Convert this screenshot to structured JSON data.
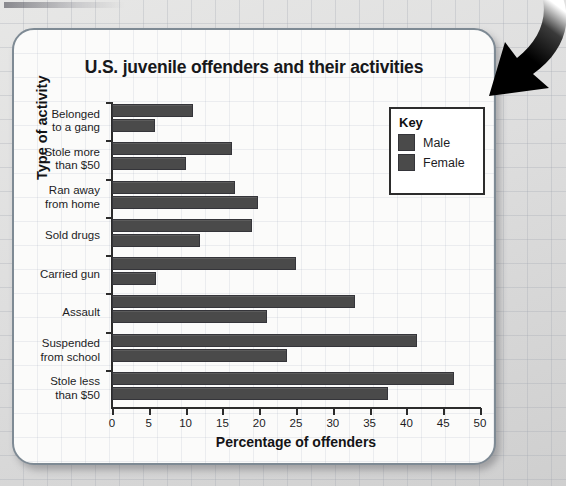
{
  "page": {
    "background_color": "#d9d9d9",
    "card_color": "#fbfbfa",
    "accent_color": "#4a4a4a",
    "axis_color": "#2c2c2c"
  },
  "annotation": {
    "arrow_name": "curved-down-left-arrow",
    "arrow_color": "#000000"
  },
  "chart_data": {
    "type": "bar",
    "orientation": "horizontal",
    "title": "U.S. juvenile offenders and their activities",
    "xlabel": "Percentage of offenders",
    "ylabel": "Type of activity",
    "xlim": [
      0,
      50
    ],
    "xticks": [
      0,
      5,
      10,
      15,
      20,
      25,
      30,
      35,
      40,
      45,
      50
    ],
    "grid": false,
    "legend_title": "Key",
    "legend_position": "upper right",
    "categories": [
      "Belonged\nto a gang",
      "Stole more\nthan $50",
      "Ran away\nfrom home",
      "Sold drugs",
      "Carried gun",
      "Assault",
      "Suspended\nfrom school",
      "Stole less\nthan $50"
    ],
    "series": [
      {
        "name": "Male",
        "color": "#4a4a4a",
        "values": [
          11,
          16.3,
          16.7,
          19,
          25,
          33,
          41.5,
          46.5
        ]
      },
      {
        "name": "Female",
        "color": "#4a4a4a",
        "values": [
          5.8,
          10,
          19.8,
          12,
          6,
          21,
          23.8,
          37.5
        ]
      }
    ]
  }
}
